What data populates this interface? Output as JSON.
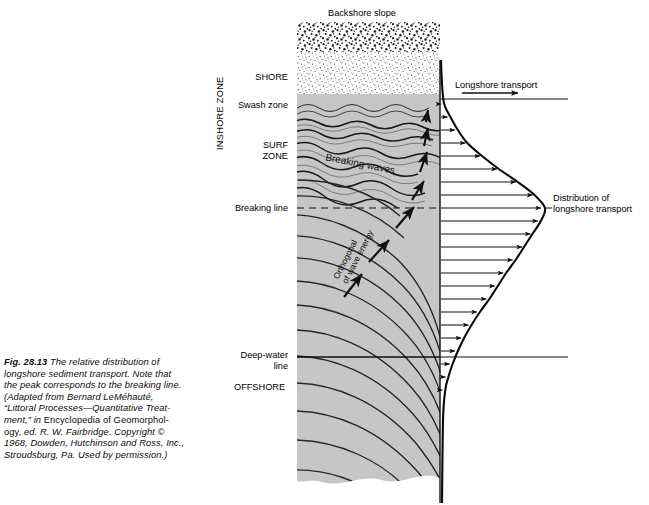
{
  "figure": {
    "number": "Fig. 28.13",
    "caption_lines": [
      "Fig. 28.13  The relative distribution of",
      "longshore sediment transport. Note that",
      "the peak corresponds to the breaking line.",
      "(Adapted from Bernard LeMéhauté,",
      "“Littoral Processes—Quantitative Treat-",
      "ment,” in Encyclopedia of Geomorphol-",
      "ogy, ed. R. W. Fairbridge. Copyright ©",
      "1968, Dowden, Hutchinson and Ross, Inc.,",
      "Stroudsburg, Pa. Used by permission.)"
    ]
  },
  "labels": {
    "backshore_slope": "Backshore slope",
    "shore": "SHORE",
    "swash_zone": "Swash zone",
    "surf_zone": "SURF\nZONE",
    "breaking_line": "Breaking line",
    "inshore_zone": "INSHORE ZONE",
    "deep_water_line": "Deep-water\nline",
    "offshore": "OFFSHORE",
    "breaking_waves": "Breaking waves",
    "orthogonal": "Orthogonal\nof wave energy",
    "longshore_transport": "Longshore transport",
    "distribution": "Distribution of\nlongshore transport"
  },
  "colors": {
    "water": "#c6c6c6",
    "water_dark": "#b8b8b8",
    "beach_sand": "#f2f2f2",
    "stroke": "#111111",
    "background": "#ffffff"
  },
  "chart_data": {
    "type": "line",
    "title": "Distribution of longshore transport",
    "xlabel": "Longshore transport",
    "ylabel": "",
    "orientation": "horizontal-profile",
    "grid": false,
    "legend": null,
    "note": "Bell-shaped profile of longshore sediment transport versus cross-shore position; peak coincides with the breaking line.",
    "y_axis_zones": [
      {
        "name": "SHORE",
        "y_px": 78
      },
      {
        "name": "Swash zone",
        "y_px": 105
      },
      {
        "name": "SURF ZONE",
        "y_px": 152
      },
      {
        "name": "Breaking line",
        "y_px": 208
      },
      {
        "name": "Deep-water line",
        "y_px": 357
      },
      {
        "name": "OFFSHORE",
        "y_px": 387
      }
    ],
    "series": [
      {
        "name": "Longshore transport magnitude",
        "y": [
          104,
          117,
          130,
          143,
          156,
          169,
          182,
          195,
          208,
          221,
          234,
          247,
          260,
          273,
          286,
          299,
          312,
          325,
          338,
          351,
          364,
          377,
          390
        ],
        "values": [
          0.04,
          0.1,
          0.17,
          0.26,
          0.4,
          0.56,
          0.74,
          0.9,
          1.0,
          0.96,
          0.88,
          0.8,
          0.72,
          0.63,
          0.55,
          0.47,
          0.38,
          0.3,
          0.23,
          0.17,
          0.12,
          0.08,
          0.05
        ]
      }
    ],
    "arrows": [
      {
        "y_px": 104,
        "length": 0.05
      },
      {
        "y_px": 117,
        "length": 0.11
      },
      {
        "y_px": 130,
        "length": 0.18
      },
      {
        "y_px": 143,
        "length": 0.28
      },
      {
        "y_px": 156,
        "length": 0.42
      },
      {
        "y_px": 169,
        "length": 0.58
      },
      {
        "y_px": 182,
        "length": 0.76
      },
      {
        "y_px": 195,
        "length": 0.92
      },
      {
        "y_px": 208,
        "length": 1.0
      },
      {
        "y_px": 221,
        "length": 0.97
      },
      {
        "y_px": 234,
        "length": 0.9
      },
      {
        "y_px": 247,
        "length": 0.82
      },
      {
        "y_px": 260,
        "length": 0.73
      },
      {
        "y_px": 273,
        "length": 0.64
      },
      {
        "y_px": 286,
        "length": 0.56
      },
      {
        "y_px": 299,
        "length": 0.48
      },
      {
        "y_px": 312,
        "length": 0.39
      },
      {
        "y_px": 325,
        "length": 0.31
      },
      {
        "y_px": 338,
        "length": 0.24
      },
      {
        "y_px": 351,
        "length": 0.18
      },
      {
        "y_px": 364,
        "length": 0.13
      },
      {
        "y_px": 377,
        "length": 0.09
      },
      {
        "y_px": 390,
        "length": 0.06
      }
    ],
    "xlim": [
      0,
      1
    ],
    "peak_at": "Breaking line"
  }
}
